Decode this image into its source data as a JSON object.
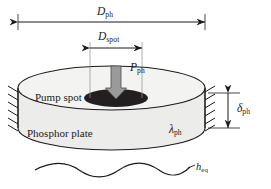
{
  "figure": {
    "background_color": "#ffffff",
    "line_color": "#1a1a1a",
    "plate_fill": "#ececeb",
    "plate_top_fill": "#f3f3f2",
    "pump_spot_fill": "#231f20",
    "arrow_fill": "#9a9a9a"
  },
  "labels": {
    "diameter_plate": {
      "symbol": "D",
      "subscript": "ph",
      "name": "plate-diameter"
    },
    "diameter_spot": {
      "symbol": "D",
      "subscript": "spot",
      "name": "pump-spot-diameter"
    },
    "pump_power": {
      "symbol": "P",
      "subscript": "ph",
      "name": "pump-power"
    },
    "pump_spot": {
      "text": "Pump spot",
      "name": "pump-spot"
    },
    "phosphor_plate": {
      "text": "Phosphor plate",
      "name": "phosphor-plate"
    },
    "thermal_conductivity": {
      "symbol": "λ",
      "subscript": "ph",
      "name": "thermal-conductivity"
    },
    "thickness": {
      "symbol": "δ",
      "subscript": "ph",
      "name": "plate-thickness"
    },
    "heat_transfer_coefficient": {
      "symbol": "h",
      "subscript": "eq",
      "name": "equivalent-heat-transfer-coefficient"
    }
  },
  "geometry": {
    "plate": {
      "center_x": 111.5,
      "top_ellipse_cy": 88,
      "rx": 93.5,
      "ry": 22,
      "thickness_px": 40
    },
    "pump_spot": {
      "cx": 116,
      "cy": 98,
      "rx": 32,
      "ry": 9
    },
    "dimension_lines": {
      "plate_diameter": {
        "x1": 18,
        "x2": 205,
        "y": 22
      },
      "spot_diameter": {
        "x1": 90,
        "x2": 142,
        "y": 48
      },
      "thickness": {
        "x": 228,
        "y1": 93,
        "y2": 128
      }
    },
    "wavy_line": {
      "x1": 35,
      "x2": 190,
      "y": 170,
      "amplitude": 4,
      "periods": 3.5
    }
  }
}
